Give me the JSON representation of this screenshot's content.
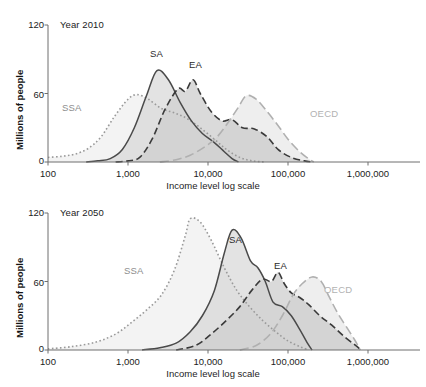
{
  "figure": {
    "xlabel": "Income level log scale",
    "ylabel": "Millions of people",
    "panels": [
      {
        "year_label": "Year 2010"
      },
      {
        "year_label": "Year 2050"
      }
    ],
    "yticks": [
      "0",
      "60",
      "120"
    ],
    "xticks": [
      "100",
      "1,000",
      "10,000",
      "100,000",
      "1,000,000"
    ],
    "series_labels": {
      "ssa": "SSA",
      "sa": "SA",
      "ea": "EA",
      "oecd": "OECD"
    },
    "colors": {
      "ssa_line": "#9a9a9a",
      "sa_line": "#4a4a4a",
      "ea_line": "#3a3a3a",
      "oecd_line": "#b0b0b0",
      "ssa_fill": "#ececec",
      "sa_fill": "#d2d2d2",
      "ea_fill": "#c3c3c3",
      "oecd_fill": "#e4e4e4",
      "axis": "#6f6f6f",
      "text": "#1c1c1c"
    }
  },
  "chart_data": [
    {
      "type": "area",
      "title": "Year 2010",
      "xlabel": "Income level log scale",
      "ylabel": "Millions of people",
      "xscale": "log",
      "xlim": [
        100,
        1000000
      ],
      "ylim": [
        0,
        120
      ],
      "yticks": [
        0,
        60,
        120
      ],
      "xticks": [
        100,
        1000,
        10000,
        100000,
        1000000
      ],
      "grid": false,
      "legend": "inline-annotations",
      "series": [
        {
          "name": "SSA",
          "style": "dotted",
          "color": "#9a9a9a",
          "peak_x": 1300,
          "peak_y": 59,
          "x": [
            100,
            150,
            220,
            320,
            460,
            680,
            1000,
            1300,
            1800,
            2600,
            3800,
            5500,
            8000,
            12000,
            17000,
            25000,
            36000,
            52000
          ],
          "y": [
            4,
            5,
            7,
            12,
            22,
            40,
            55,
            59,
            55,
            47,
            43,
            38,
            30,
            20,
            11,
            4,
            1,
            0
          ]
        },
        {
          "name": "SA",
          "style": "solid",
          "color": "#4a4a4a",
          "peak_x": 2300,
          "peak_y": 80,
          "x": [
            300,
            420,
            600,
            850,
            1200,
            1700,
            2300,
            3200,
            4500,
            6200,
            8500,
            12000,
            16000,
            20000,
            24000
          ],
          "y": [
            0,
            1,
            3,
            11,
            30,
            58,
            80,
            72,
            52,
            36,
            25,
            17,
            9,
            3,
            0
          ]
        },
        {
          "name": "EA",
          "style": "dashed",
          "color": "#3a3a3a",
          "peak_x": 6500,
          "peak_y": 72,
          "x": [
            700,
            1000,
            1400,
            2000,
            2900,
            4200,
            5200,
            6500,
            8000,
            11000,
            15000,
            20000,
            27000,
            38000,
            55000,
            75000,
            110000,
            160000,
            210000
          ],
          "y": [
            0,
            1,
            4,
            20,
            46,
            64,
            62,
            72,
            60,
            44,
            36,
            37,
            30,
            29,
            22,
            11,
            4,
            1,
            0
          ]
        },
        {
          "name": "OECD",
          "style": "longdash",
          "color": "#b0b0b0",
          "peak_x": 30000,
          "peak_y": 58,
          "x": [
            2500,
            4000,
            6000,
            9000,
            13000,
            18000,
            24000,
            30000,
            40000,
            55000,
            75000,
            100000,
            140000,
            180000,
            210000
          ],
          "y": [
            0,
            2,
            6,
            13,
            22,
            35,
            48,
            58,
            55,
            44,
            32,
            20,
            9,
            3,
            0
          ]
        }
      ]
    },
    {
      "type": "area",
      "title": "Year 2050",
      "xlabel": "Income level log scale",
      "ylabel": "Millions of people",
      "xscale": "log",
      "xlim": [
        100,
        1000000
      ],
      "ylim": [
        0,
        120
      ],
      "yticks": [
        0,
        60,
        120
      ],
      "xticks": [
        100,
        1000,
        10000,
        100000,
        1000000
      ],
      "grid": false,
      "legend": "inline-annotations",
      "series": [
        {
          "name": "SSA",
          "style": "dotted",
          "color": "#9a9a9a",
          "peak_x": 6000,
          "peak_y": 115,
          "x": [
            100,
            200,
            400,
            700,
            1100,
            1700,
            2600,
            3800,
            5200,
            6000,
            8000,
            11000,
            16000,
            23000,
            33000,
            48000,
            70000,
            100000,
            140000,
            180000
          ],
          "y": [
            1,
            3,
            7,
            14,
            24,
            35,
            48,
            70,
            100,
            115,
            112,
            96,
            72,
            52,
            38,
            26,
            16,
            8,
            3,
            0
          ]
        },
        {
          "name": "SA",
          "style": "solid",
          "color": "#4a4a4a",
          "peak_x": 20000,
          "peak_y": 105,
          "x": [
            1500,
            2500,
            4000,
            6000,
            8500,
            12000,
            16000,
            20000,
            26000,
            34000,
            42000,
            52000,
            65000,
            85000,
            110000,
            140000,
            175000,
            200000
          ],
          "y": [
            0,
            2,
            6,
            16,
            30,
            52,
            85,
            105,
            98,
            78,
            72,
            60,
            42,
            38,
            30,
            18,
            6,
            0
          ]
        },
        {
          "name": "EA",
          "style": "dashed",
          "color": "#3a3a3a",
          "peak_x": 75000,
          "peak_y": 68,
          "x": [
            4000,
            7000,
            11000,
            17000,
            25000,
            35000,
            48000,
            62000,
            75000,
            90000,
            110000,
            140000,
            180000,
            250000,
            350000,
            500000,
            700000,
            820000
          ],
          "y": [
            0,
            4,
            14,
            26,
            38,
            52,
            62,
            60,
            68,
            58,
            50,
            46,
            40,
            30,
            22,
            12,
            4,
            0
          ]
        },
        {
          "name": "OECD",
          "style": "longdash",
          "color": "#b0b0b0",
          "peak_x": 200000,
          "peak_y": 64,
          "x": [
            25000,
            40000,
            60000,
            85000,
            115000,
            150000,
            200000,
            260000,
            330000,
            420000,
            540000,
            680000,
            800000
          ],
          "y": [
            0,
            4,
            14,
            30,
            48,
            58,
            64,
            60,
            46,
            32,
            20,
            9,
            0
          ]
        }
      ]
    }
  ]
}
